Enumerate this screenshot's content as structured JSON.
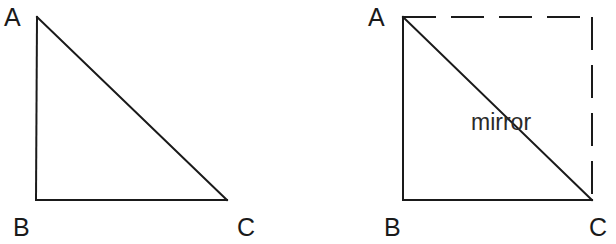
{
  "left_figure": {
    "description": "Right triangle ABC",
    "labels": {
      "a": "A",
      "b": "B",
      "c": "C"
    }
  },
  "right_figure": {
    "description": "Triangle ABC mirrored across hypotenuse AC forming a square (dashed completion)",
    "labels": {
      "a": "A",
      "b": "B",
      "c": "C"
    },
    "mirror_label": "mirror"
  },
  "colors": {
    "line": "#1a1a1a",
    "background": "#ffffff"
  }
}
